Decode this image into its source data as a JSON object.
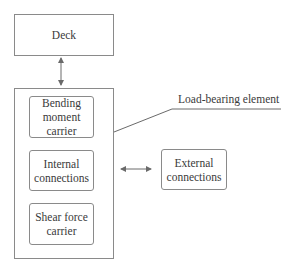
{
  "diagram": {
    "deck": {
      "label": "Deck"
    },
    "load_bearing_element": {
      "label": "Load-bearing element",
      "components": [
        {
          "label": "Bending moment carrier"
        },
        {
          "label": "Internal connections"
        },
        {
          "label": "Shear force carrier"
        }
      ]
    },
    "external": {
      "label": "External connections"
    },
    "arrows": [
      {
        "from": "Deck",
        "to": "Load-bearing element",
        "type": "bidirectional"
      },
      {
        "from": "Load-bearing element",
        "to": "External connections",
        "type": "bidirectional"
      }
    ],
    "colors": {
      "stroke": "#8a8a8a",
      "text": "#3a3a3a"
    }
  }
}
